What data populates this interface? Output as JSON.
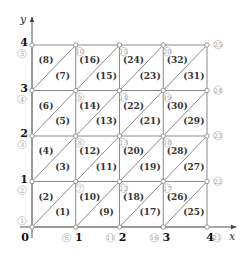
{
  "diagram": {
    "colors": {
      "line": "#8a8a8a",
      "axis": "#555555",
      "node_number": "#9a9a9a",
      "tick": "#111111"
    },
    "axes": {
      "x_label": "x",
      "y_label": "y",
      "x_ticks": [
        "0",
        "1",
        "2",
        "3",
        "4"
      ],
      "y_ticks": [
        "0",
        "1",
        "2",
        "3",
        "4"
      ]
    },
    "grid": {
      "nx": 4,
      "ny": 4,
      "origin_px": [
        32,
        227
      ],
      "dx_px": 43.75,
      "dy_px": 45.5
    },
    "nodes": [
      {
        "id": "1",
        "i": 0,
        "j": 0
      },
      {
        "id": "2",
        "i": 0,
        "j": 1
      },
      {
        "id": "3",
        "i": 0,
        "j": 2
      },
      {
        "id": "4",
        "i": 0,
        "j": 3
      },
      {
        "id": "5",
        "i": 0,
        "j": 4
      },
      {
        "id": "6",
        "i": 1,
        "j": 0
      },
      {
        "id": "7",
        "i": 1,
        "j": 1
      },
      {
        "id": "8",
        "i": 1,
        "j": 2
      },
      {
        "id": "9",
        "i": 1,
        "j": 3
      },
      {
        "id": "10",
        "i": 1,
        "j": 4
      },
      {
        "id": "11",
        "i": 2,
        "j": 0
      },
      {
        "id": "12",
        "i": 2,
        "j": 1
      },
      {
        "id": "13",
        "i": 2,
        "j": 2
      },
      {
        "id": "14",
        "i": 2,
        "j": 3
      },
      {
        "id": "15",
        "i": 2,
        "j": 4
      },
      {
        "id": "16",
        "i": 3,
        "j": 0
      },
      {
        "id": "17",
        "i": 3,
        "j": 1
      },
      {
        "id": "18",
        "i": 3,
        "j": 2
      },
      {
        "id": "19",
        "i": 3,
        "j": 3
      },
      {
        "id": "20",
        "i": 3,
        "j": 4
      },
      {
        "id": "21",
        "i": 4,
        "j": 0
      },
      {
        "id": "22",
        "i": 4,
        "j": 1
      },
      {
        "id": "23",
        "i": 4,
        "j": 2
      },
      {
        "id": "24",
        "i": 4,
        "j": 3
      },
      {
        "id": "25",
        "i": 4,
        "j": 4
      }
    ],
    "elements": [
      {
        "id": "(1)",
        "i": 0,
        "j": 0,
        "pos": "lower"
      },
      {
        "id": "(2)",
        "i": 0,
        "j": 0,
        "pos": "upper"
      },
      {
        "id": "(3)",
        "i": 0,
        "j": 1,
        "pos": "lower"
      },
      {
        "id": "(4)",
        "i": 0,
        "j": 1,
        "pos": "upper"
      },
      {
        "id": "(5)",
        "i": 0,
        "j": 2,
        "pos": "lower"
      },
      {
        "id": "(6)",
        "i": 0,
        "j": 2,
        "pos": "upper"
      },
      {
        "id": "(7)",
        "i": 0,
        "j": 3,
        "pos": "lower"
      },
      {
        "id": "(8)",
        "i": 0,
        "j": 3,
        "pos": "upper"
      },
      {
        "id": "(9)",
        "i": 1,
        "j": 0,
        "pos": "lower"
      },
      {
        "id": "(10)",
        "i": 1,
        "j": 0,
        "pos": "upper"
      },
      {
        "id": "(11)",
        "i": 1,
        "j": 1,
        "pos": "lower"
      },
      {
        "id": "(12)",
        "i": 1,
        "j": 1,
        "pos": "upper"
      },
      {
        "id": "(13)",
        "i": 1,
        "j": 2,
        "pos": "lower"
      },
      {
        "id": "(14)",
        "i": 1,
        "j": 2,
        "pos": "upper"
      },
      {
        "id": "(15)",
        "i": 1,
        "j": 3,
        "pos": "lower"
      },
      {
        "id": "(16)",
        "i": 1,
        "j": 3,
        "pos": "upper"
      },
      {
        "id": "(17)",
        "i": 2,
        "j": 0,
        "pos": "lower"
      },
      {
        "id": "(18)",
        "i": 2,
        "j": 0,
        "pos": "upper"
      },
      {
        "id": "(19)",
        "i": 2,
        "j": 1,
        "pos": "lower"
      },
      {
        "id": "(20)",
        "i": 2,
        "j": 1,
        "pos": "upper"
      },
      {
        "id": "(21)",
        "i": 2,
        "j": 2,
        "pos": "lower"
      },
      {
        "id": "(22)",
        "i": 2,
        "j": 2,
        "pos": "upper"
      },
      {
        "id": "(23)",
        "i": 2,
        "j": 3,
        "pos": "lower"
      },
      {
        "id": "(24)",
        "i": 2,
        "j": 3,
        "pos": "upper"
      },
      {
        "id": "(25)",
        "i": 3,
        "j": 0,
        "pos": "lower"
      },
      {
        "id": "(26)",
        "i": 3,
        "j": 0,
        "pos": "upper"
      },
      {
        "id": "(27)",
        "i": 3,
        "j": 1,
        "pos": "lower"
      },
      {
        "id": "(28)",
        "i": 3,
        "j": 1,
        "pos": "upper"
      },
      {
        "id": "(29)",
        "i": 3,
        "j": 2,
        "pos": "lower"
      },
      {
        "id": "(30)",
        "i": 3,
        "j": 2,
        "pos": "upper"
      },
      {
        "id": "(31)",
        "i": 3,
        "j": 3,
        "pos": "lower"
      },
      {
        "id": "(32)",
        "i": 3,
        "j": 3,
        "pos": "upper"
      }
    ]
  }
}
